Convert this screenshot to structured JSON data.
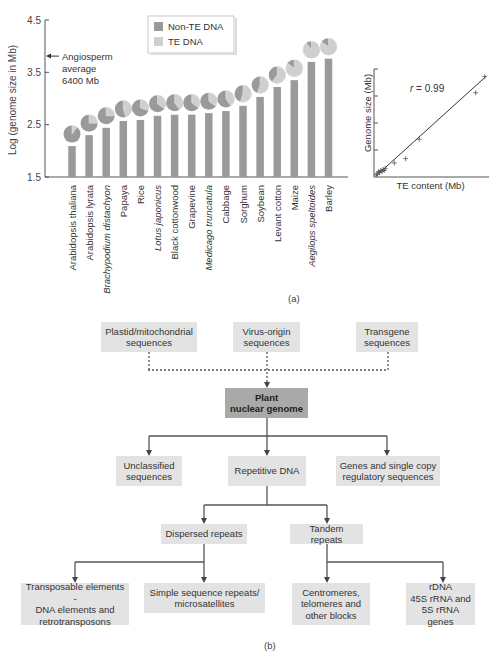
{
  "panel_a_label": "(a)",
  "panel_b_label": "(b)",
  "colors": {
    "non_te": "#9a9a9a",
    "te": "#cfcfcf",
    "box": "#e3e3e3",
    "box_main": "#a9a9a9",
    "line": "#555555"
  },
  "chart_data": [
    {
      "type": "bar",
      "title": "",
      "xlabel": "",
      "ylabel": "Log (genome size in Mb)",
      "ylim": [
        1.5,
        4.5
      ],
      "yticks": [
        1.5,
        2.5,
        3.5,
        4.5
      ],
      "grid": false,
      "legend": {
        "position": "top-center",
        "entries": [
          "Non-TE DNA",
          "TE DNA"
        ]
      },
      "annotations": [
        {
          "text": "Angiosperm average 6400 Mb",
          "lines": [
            "Angiosperm",
            "average",
            "6400 Mb"
          ],
          "y": 3.81,
          "arrow": "left-pointing at y-axis"
        }
      ],
      "categories": [
        "Arabidopsis thaliana",
        "Arabidopsis lyrata",
        "Brachypodium distachyon",
        "Papaya",
        "Rice",
        "Lotus japonicus",
        "Black cottonwood",
        "Grapevine",
        "Medicago truncatula",
        "Cabbage",
        "Sorghum",
        "Soybean",
        "Levant cotton",
        "Maize",
        "Aegilops speltoides",
        "Barley"
      ],
      "italic_categories": [
        "Brachypodium distachyon",
        "Lotus japonicus",
        "Medicago truncatula",
        "Aegilops speltoides"
      ],
      "values": [
        2.09,
        2.3,
        2.44,
        2.57,
        2.59,
        2.67,
        2.69,
        2.69,
        2.72,
        2.76,
        2.86,
        3.03,
        3.22,
        3.35,
        3.7,
        3.76
      ],
      "te_fraction_pies": [
        0.1,
        0.25,
        0.25,
        0.45,
        0.3,
        0.35,
        0.4,
        0.35,
        0.35,
        0.4,
        0.55,
        0.55,
        0.6,
        0.85,
        0.9,
        0.85
      ]
    },
    {
      "type": "scatter",
      "title": "",
      "xlabel": "TE content (Mb)",
      "ylabel": "Genome size (Mb)",
      "annotations": [
        {
          "text": "r = 0.99"
        }
      ],
      "fit_line": true,
      "x_norm": [
        0.02,
        0.03,
        0.04,
        0.05,
        0.06,
        0.07,
        0.08,
        0.09,
        0.1,
        0.18,
        0.28,
        0.4,
        0.9,
        0.98
      ],
      "y_norm": [
        0.02,
        0.03,
        0.05,
        0.04,
        0.06,
        0.05,
        0.07,
        0.06,
        0.08,
        0.13,
        0.17,
        0.35,
        0.78,
        0.93
      ]
    }
  ],
  "diagram": {
    "sources": [
      {
        "id": "plastid",
        "text": "Plastid/mitochondrial sequences",
        "lines": [
          "Plastid/mitochondrial",
          "sequences"
        ]
      },
      {
        "id": "virus",
        "text": "Virus-origin sequences",
        "lines": [
          "Virus-origin",
          "sequences"
        ]
      },
      {
        "id": "transgene",
        "text": "Transgene sequences",
        "lines": [
          "Transgene",
          "sequences"
        ]
      }
    ],
    "root": {
      "lines": [
        "Plant",
        "nuclear genome"
      ]
    },
    "level1": [
      {
        "id": "unclassified",
        "lines": [
          "Unclassified",
          "sequences"
        ]
      },
      {
        "id": "repetitive",
        "lines": [
          "Repetitive DNA"
        ]
      },
      {
        "id": "genes",
        "lines": [
          "Genes and single copy",
          "regulatory sequences"
        ]
      }
    ],
    "level2": [
      {
        "id": "dispersed",
        "lines": [
          "Dispersed repeats"
        ]
      },
      {
        "id": "tandem",
        "lines": [
          "Tandem repeats"
        ]
      }
    ],
    "level3": [
      {
        "id": "transposable",
        "lines": [
          "Transposable elements -",
          "DNA elements and",
          "retrotransposons"
        ]
      },
      {
        "id": "ssr",
        "lines": [
          "Simple sequence repeats/",
          "microsatellites"
        ]
      },
      {
        "id": "centromeres",
        "lines": [
          "Centromeres,",
          "telomeres and",
          "other blocks"
        ]
      },
      {
        "id": "rdna",
        "lines": [
          "rDNA",
          "45S rRNA and",
          "5S rRNA genes"
        ]
      }
    ]
  }
}
